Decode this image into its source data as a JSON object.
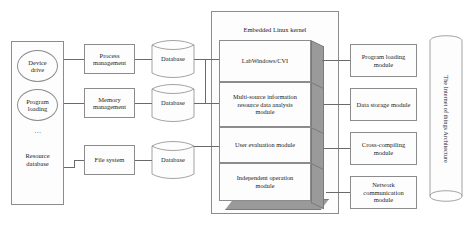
{
  "diagram": {
    "title": "The Internet of things Architecture",
    "type": "block-architecture-diagram",
    "colors": {
      "stroke": "#8c8c8c",
      "connector": "#6a6a6a",
      "slab_shadow": "#9a9a9a",
      "background": "#ffffff",
      "text": "#1d1d1d"
    },
    "resource_panel": {
      "name": "resource-panel",
      "items": [
        {
          "label": "Device\ndrive",
          "shape": "ellipse"
        },
        {
          "label": "Program\nloading",
          "shape": "ellipse"
        },
        {
          "label": "…",
          "shape": "ellipsis"
        },
        {
          "label": "Resource\ndatabase",
          "shape": "text"
        }
      ]
    },
    "management_boxes": [
      {
        "label": "Process\nmanagement"
      },
      {
        "label": "Memory\nmanagement"
      },
      {
        "label": "File system"
      }
    ],
    "databases": [
      {
        "label": "Database"
      },
      {
        "label": "Database"
      },
      {
        "label": "Database"
      }
    ],
    "kernel": {
      "title": "Embedded Linux kernel",
      "layers": [
        {
          "label": "LabWindows/CVI"
        },
        {
          "label": "Multi-source information\nresource data analysis\nmodule"
        },
        {
          "label": "User evaluation module"
        },
        {
          "label": "Independent operation\nmodule"
        }
      ]
    },
    "modules": [
      {
        "label": "Program loading\nmodule"
      },
      {
        "label": "Data storage module"
      },
      {
        "label": "Cross-compiling\nmodule"
      },
      {
        "label": "Network\ncommunication\nmodule"
      }
    ],
    "iot_cylinder": {
      "label": "The Internet of things Architecture"
    }
  }
}
